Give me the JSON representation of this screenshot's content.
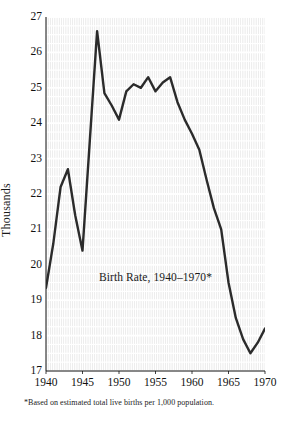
{
  "chart_data": {
    "type": "line",
    "title": "Birth Rate, 1940–1970*",
    "xlabel": "",
    "ylabel": "Thousands",
    "xlim": [
      1940,
      1970
    ],
    "ylim": [
      17,
      27
    ],
    "grid": true,
    "legend": "none",
    "footnote": "*Based on estimated total live births per 1,000 population.",
    "x_ticks": [
      "1940",
      "1945",
      "1950",
      "1955",
      "1960",
      "1965",
      "1970"
    ],
    "x_tick_values": [
      1940,
      1945,
      1950,
      1955,
      1960,
      1965,
      1970
    ],
    "y_ticks": [
      "17",
      "18",
      "19",
      "20",
      "21",
      "22",
      "23",
      "24",
      "25",
      "26",
      "27"
    ],
    "y_tick_values": [
      17,
      18,
      19,
      20,
      21,
      22,
      23,
      24,
      25,
      26,
      27
    ],
    "x": [
      1940,
      1941,
      1942,
      1943,
      1944,
      1945,
      1946,
      1947,
      1948,
      1949,
      1950,
      1951,
      1952,
      1953,
      1954,
      1955,
      1956,
      1957,
      1958,
      1959,
      1960,
      1961,
      1962,
      1963,
      1964,
      1965,
      1966,
      1967,
      1968,
      1969,
      1970
    ],
    "values": [
      19.35,
      20.6,
      22.2,
      22.7,
      21.4,
      20.4,
      23.5,
      26.6,
      24.85,
      24.5,
      24.1,
      24.9,
      25.1,
      25.0,
      25.3,
      24.9,
      25.15,
      25.3,
      24.6,
      24.1,
      23.7,
      23.25,
      22.4,
      21.6,
      21.0,
      19.5,
      18.5,
      17.9,
      17.5,
      17.8,
      18.2
    ],
    "series": [
      {
        "name": "Birth Rate",
        "color": "#2b2b2b",
        "values": [
          19.35,
          20.6,
          22.2,
          22.7,
          21.4,
          20.4,
          23.5,
          26.6,
          24.85,
          24.5,
          24.1,
          24.9,
          25.1,
          25.0,
          25.3,
          24.9,
          25.15,
          25.3,
          24.6,
          24.1,
          23.7,
          23.25,
          22.4,
          21.6,
          21.0,
          19.5,
          18.5,
          17.9,
          17.5,
          17.8,
          18.2
        ]
      }
    ],
    "annotations": [
      {
        "text": "Birth Rate, 1940–1970*",
        "x": 1955.0,
        "y": 19.6
      }
    ],
    "colors": {
      "line": "#2b2b2b",
      "grid_block": "#dcdcdc",
      "grid_line": "#ffffff",
      "text": "#111111",
      "background": "#ffffff"
    }
  }
}
